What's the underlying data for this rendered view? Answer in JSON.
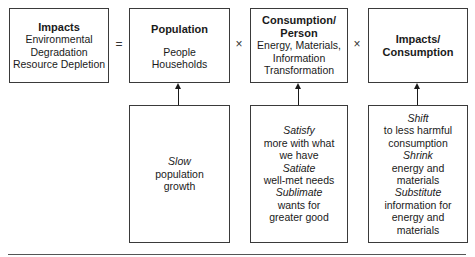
{
  "top_row": {
    "impacts": {
      "title": "Impacts",
      "lines": [
        "Environmental",
        "Degradation",
        "Resource Depletion"
      ]
    },
    "equals": "=",
    "population": {
      "title": "Population",
      "lines": [
        "People",
        "Households"
      ]
    },
    "times_1": "×",
    "consumption_per_person": {
      "title_1": "Consumption/",
      "title_2": "Person",
      "lines": [
        "Energy, Materials,",
        "Information",
        "Transformation"
      ]
    },
    "times_2": "×",
    "impacts_per_consumption": {
      "title_1": "Impacts/",
      "title_2": "Consumption"
    }
  },
  "bottom_row": {
    "population_strategy": {
      "lines": [
        {
          "text": "Slow",
          "italic": true
        },
        {
          "text": "population",
          "italic": false
        },
        {
          "text": "growth",
          "italic": false
        }
      ]
    },
    "consumption_strategy": {
      "lines": [
        {
          "text": "Satisfy",
          "italic": true
        },
        {
          "text": "more with what",
          "italic": false
        },
        {
          "text": "we have",
          "italic": false
        },
        {
          "text": "Satiate",
          "italic": true
        },
        {
          "text": "well-met needs",
          "italic": false
        },
        {
          "text": "Sublimate",
          "italic": true
        },
        {
          "text": "wants for",
          "italic": false
        },
        {
          "text": "greater good",
          "italic": false
        }
      ]
    },
    "impact_strategy": {
      "lines": [
        {
          "text": "Shift",
          "italic": true
        },
        {
          "text": "to less harmful",
          "italic": false
        },
        {
          "text": "consumption",
          "italic": false
        },
        {
          "text": "Shrink",
          "italic": true
        },
        {
          "text": "energy and",
          "italic": false
        },
        {
          "text": "materials",
          "italic": false
        },
        {
          "text": "Substitute",
          "italic": true
        },
        {
          "text": "information for",
          "italic": false
        },
        {
          "text": "energy and",
          "italic": false
        },
        {
          "text": "materials",
          "italic": false
        }
      ]
    }
  }
}
